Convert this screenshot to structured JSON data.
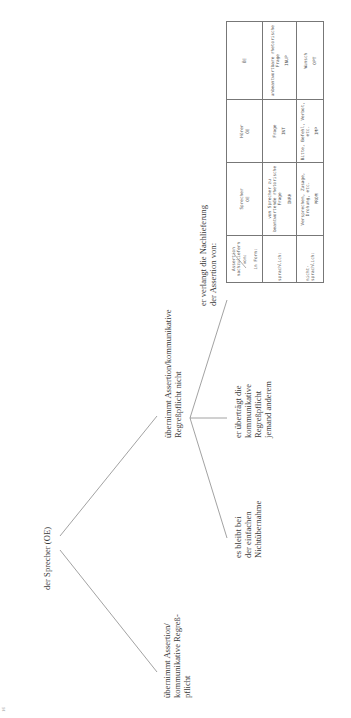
{
  "page_number": "16",
  "tree": {
    "root": "der Sprecher (OE)",
    "left_branch": [
      "übernimmt Assertion/",
      "kommunikative Regreß-",
      "pflicht"
    ],
    "right_branch": [
      "übernimmt Assertion/kommunikative",
      "Regreßpflicht nicht"
    ],
    "children": {
      "leaf_1": [
        "es bleibt bei",
        "der einfachen",
        "Nichtübernahme"
      ],
      "leaf_2": [
        "er überträgt die",
        "kommunikative",
        "Regreßpflicht",
        "jemand anderem"
      ],
      "leaf_3": [
        "er verlangt die Nachlieferung",
        "der Assertion von:"
      ]
    }
  },
  "table": {
    "corner": {
      "top": "Assertion nachzuliefern von:",
      "bottom": "in Form:"
    },
    "columns": [
      {
        "label": "Sprecher",
        "sub": "OE"
      },
      {
        "label": "Hörer",
        "sub": "ÖE"
      },
      {
        "label": "",
        "sub": "ŌE"
      }
    ],
    "rows": [
      {
        "label": "sprachlich:",
        "cells": [
          {
            "text": "vom Sprecher zu beantwortende rhetorische Frage",
            "code": "INRH"
          },
          {
            "text": "Frage",
            "code": "INT"
          },
          {
            "text": "unbeantwortbare rhetorische Frage",
            "code": "INUP"
          }
        ]
      },
      {
        "label": "nicht-sprachlich:",
        "cells": [
          {
            "text": "Versprechen, Zusage, Drohung, etc.",
            "code": "PROM"
          },
          {
            "text": "Bitte, Befehl, Verbot, etc.",
            "code": "IMP"
          },
          {
            "text": "Wunsch",
            "code": "OPT"
          }
        ]
      }
    ]
  }
}
